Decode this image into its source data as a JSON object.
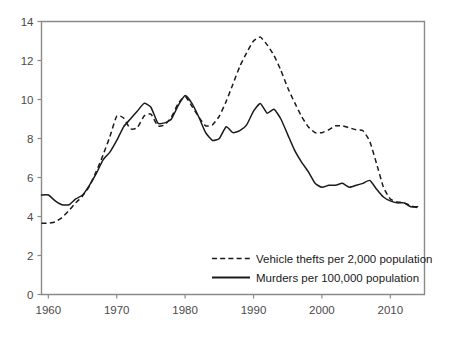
{
  "chart_data": {
    "type": "line",
    "title": "",
    "subtitle": "",
    "xlabel": "",
    "ylabel": "",
    "xlim": [
      1959,
      2015
    ],
    "ylim": [
      0,
      14
    ],
    "grid": false,
    "legend_position": "inside-bottom-right",
    "x_ticks": [
      "1960",
      "1970",
      "1980",
      "1990",
      "2000",
      "2010"
    ],
    "x_tick_values": [
      1960,
      1970,
      1980,
      1990,
      2000,
      2010
    ],
    "y_ticks": [
      "0",
      "2",
      "4",
      "6",
      "8",
      "10",
      "12",
      "14"
    ],
    "y_tick_values": [
      0,
      2,
      4,
      6,
      8,
      10,
      12,
      14
    ],
    "x": [
      1959,
      1960,
      1961,
      1962,
      1963,
      1964,
      1965,
      1966,
      1967,
      1968,
      1969,
      1970,
      1971,
      1972,
      1973,
      1974,
      1975,
      1976,
      1977,
      1978,
      1979,
      1980,
      1981,
      1982,
      1983,
      1984,
      1985,
      1986,
      1987,
      1988,
      1989,
      1990,
      1991,
      1992,
      1993,
      1994,
      1995,
      1996,
      1997,
      1998,
      1999,
      2000,
      2001,
      2002,
      2003,
      2004,
      2005,
      2006,
      2007,
      2008,
      2009,
      2010,
      2011,
      2012,
      2013,
      2014
    ],
    "series": [
      {
        "name": "Vehicle thefts per 2,000 population",
        "style": "dashed",
        "color": "#1a1a1a",
        "values": [
          3.65,
          3.66,
          3.72,
          3.95,
          4.3,
          4.7,
          5.05,
          5.55,
          6.3,
          7.15,
          8.1,
          9.15,
          9.05,
          8.5,
          8.55,
          9.15,
          9.25,
          8.65,
          8.7,
          9.1,
          9.8,
          10.15,
          9.65,
          9.1,
          8.65,
          8.7,
          9.15,
          9.9,
          10.8,
          11.7,
          12.4,
          13.0,
          13.2,
          12.8,
          12.25,
          11.5,
          10.6,
          9.85,
          9.15,
          8.6,
          8.3,
          8.3,
          8.45,
          8.65,
          8.65,
          8.55,
          8.45,
          8.4,
          7.85,
          6.7,
          5.5,
          4.9,
          4.75,
          4.7,
          4.55,
          4.45
        ]
      },
      {
        "name": "Murders per 100,000 population",
        "style": "solid",
        "color": "#1a1a1a",
        "values": [
          5.1,
          5.1,
          4.8,
          4.6,
          4.6,
          4.9,
          5.1,
          5.6,
          6.2,
          6.9,
          7.3,
          7.9,
          8.6,
          9.0,
          9.4,
          9.8,
          9.6,
          8.8,
          8.8,
          9.0,
          9.7,
          10.2,
          9.8,
          9.1,
          8.3,
          7.9,
          8.0,
          8.6,
          8.3,
          8.4,
          8.7,
          9.4,
          9.8,
          9.3,
          9.5,
          9.0,
          8.2,
          7.4,
          6.8,
          6.3,
          5.7,
          5.5,
          5.6,
          5.6,
          5.7,
          5.5,
          5.6,
          5.7,
          5.85,
          5.4,
          5.0,
          4.8,
          4.7,
          4.7,
          4.5,
          4.5
        ]
      }
    ],
    "legend": [
      {
        "label": "Vehicle thefts per 2,000 population",
        "style": "dashed"
      },
      {
        "label": "Murders per 100,000 population",
        "style": "solid"
      }
    ]
  }
}
